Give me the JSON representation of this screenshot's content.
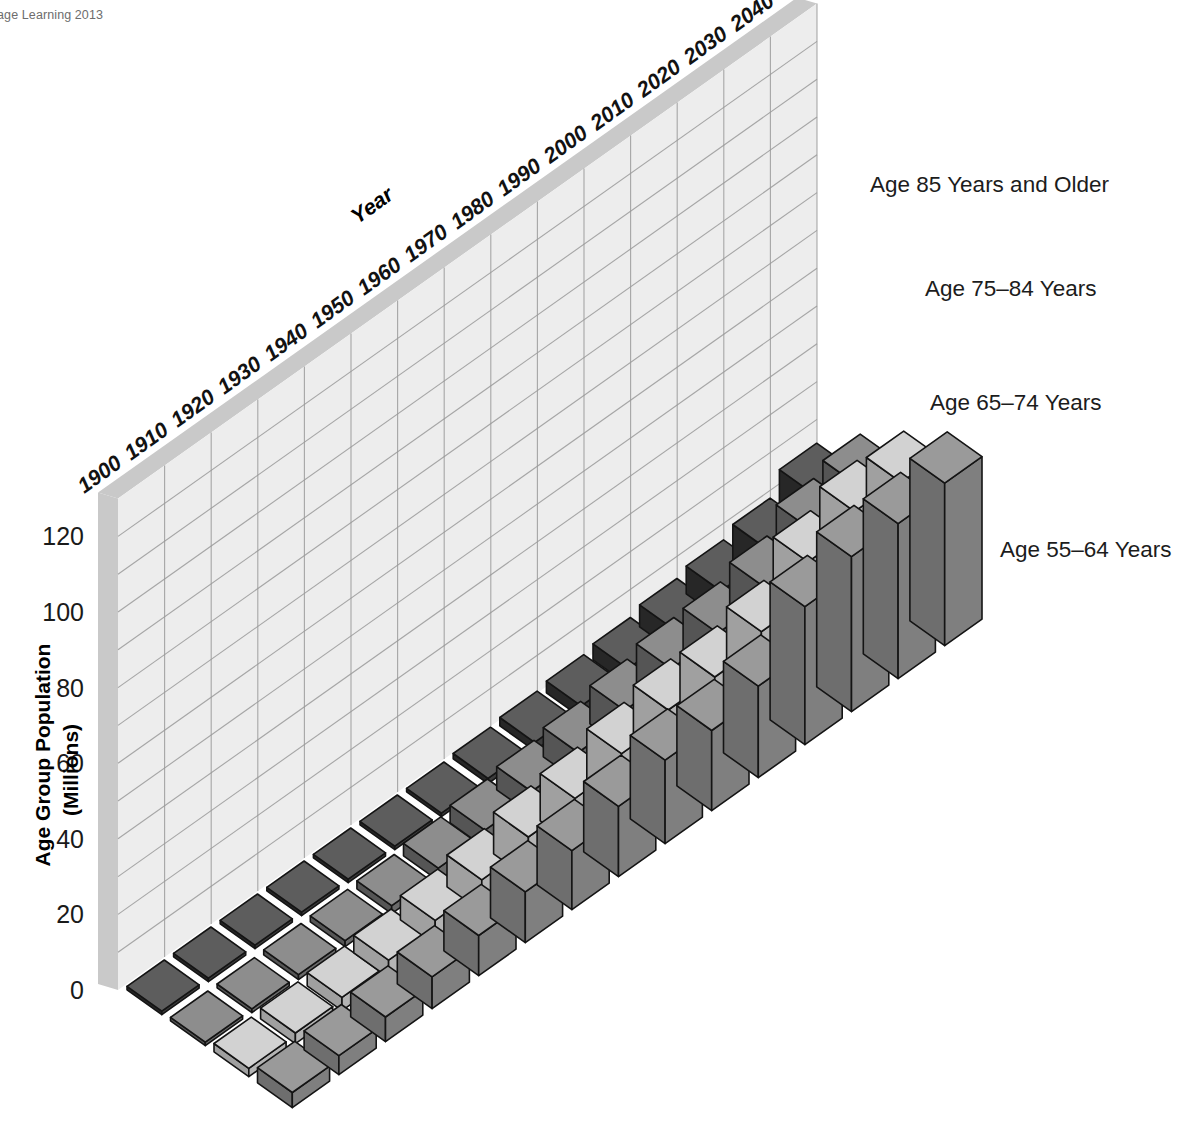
{
  "credit": "gage Learning 2013",
  "axes": {
    "y_title_line1": "Age Group Population",
    "y_title_line2": "(Millions)",
    "y_ticks": [
      "0",
      "20",
      "40",
      "60",
      "80",
      "100",
      "120"
    ],
    "x_title": "Year"
  },
  "series_labels": [
    "Age 85 Years and Older",
    "Age 75–84 Years",
    "Age 65–74 Years",
    "Age 55–64 Years"
  ],
  "colors": {
    "s85_top": "#5d5d5d",
    "s85_front": "#272727",
    "s85_side": "#3c3c3c",
    "s75_top": "#8d8d8d",
    "s75_front": "#555555",
    "s75_side": "#6a6a6a",
    "s65_top": "#d2d2d2",
    "s65_front": "#a0a0a0",
    "s65_side": "#b4b4b4",
    "s55_top": "#9a9a9a",
    "s55_front": "#6e6e6e",
    "s55_side": "#7f7f7f",
    "wall_back": "#ededed",
    "wall_edge": "#c9c9c9",
    "gridline": "#9a9a9a",
    "outline": "#141414",
    "text": "#1a1a1a"
  },
  "chart_data": {
    "type": "bar",
    "title": "",
    "xlabel": "Year",
    "ylabel": "Age Group Population (Millions)",
    "ylim": [
      0,
      130
    ],
    "ytick_step": 20,
    "grid_minor_step": 10,
    "grid": true,
    "legend_position": "right-inline",
    "projection": "3d-isometric",
    "categories": [
      "1900",
      "1910",
      "1920",
      "1930",
      "1940",
      "1950",
      "1960",
      "1970",
      "1980",
      "1990",
      "2000",
      "2010",
      "2020",
      "2030",
      "2040"
    ],
    "series": [
      {
        "name": "Age 85 Years and Older",
        "values": [
          0.1,
          0.2,
          0.2,
          0.3,
          0.4,
          0.6,
          0.9,
          1.4,
          2.2,
          3.1,
          4.2,
          5.8,
          7.3,
          9.6,
          15.4
        ]
      },
      {
        "name": "Age 75–84 Years",
        "values": [
          0.8,
          1.0,
          1.3,
          1.6,
          2.1,
          3.3,
          4.6,
          6.1,
          7.7,
          10.1,
          12.4,
          13.1,
          16.5,
          23.0,
          26.0
        ]
      },
      {
        "name": "Age 65–74 Years",
        "values": [
          2.2,
          2.8,
          3.5,
          4.6,
          6.4,
          8.4,
          11.0,
          12.5,
          15.6,
          18.4,
          18.4,
          21.7,
          31.4,
          36.0,
          35.0
        ]
      },
      {
        "name": "Age 55–64 Years",
        "values": [
          4.0,
          5.0,
          6.5,
          8.4,
          10.6,
          13.4,
          15.6,
          18.6,
          22.1,
          21.2,
          24.2,
          36.5,
          41.0,
          41.0,
          43.0
        ]
      }
    ]
  }
}
